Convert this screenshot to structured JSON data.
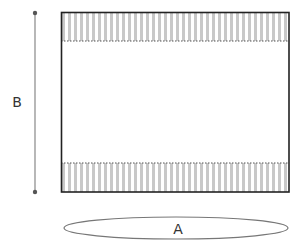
{
  "diagram": {
    "labels": {
      "width_label": "A",
      "height_label": "B"
    },
    "colors": {
      "outline": "#222222",
      "stripe": "#c8c8c8",
      "dimension_line": "#777777",
      "dot": "#555555",
      "dotted_boundary": "#555555",
      "ellipse": "#777777",
      "text": "#333333"
    },
    "rect": {
      "x": 61,
      "y": 12,
      "width": 228,
      "height": 180
    },
    "bands": [
      {
        "name": "top",
        "y": 12,
        "height": 29
      },
      {
        "name": "bottom",
        "y": 163,
        "height": 29
      }
    ],
    "dimension_b": {
      "x": 35,
      "y1": 13,
      "y2": 192
    },
    "ellipse_a": {
      "cx": 176,
      "cy": 228,
      "rx": 112,
      "ry": 11
    }
  }
}
